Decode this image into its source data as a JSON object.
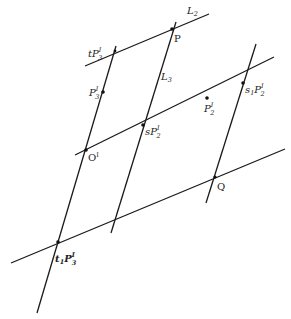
{
  "diagram": {
    "labels": {
      "L2": "L",
      "L2_sub": "2",
      "L3": "L",
      "L3_sub": "3",
      "P": "P",
      "tP3": "tP",
      "tP3_sub": "3",
      "tP3_sup": "I",
      "P3": "P",
      "P3_sub": "3",
      "P3_sup": "I",
      "O": "O",
      "O_sup": "I",
      "sP2": "sP",
      "sP2_sub": "2",
      "sP2_sup": "I",
      "P2": "P",
      "P2_sub": "2",
      "P2_sup": "I",
      "s1P2": "s",
      "s1P2_s_sub": "1",
      "s1P2_P": "P",
      "s1P2_sub": "2",
      "s1P2_sup": "I",
      "Q": "Q",
      "t1P3": "t",
      "t1P3_t_sub": "1",
      "t1P3_P": "P",
      "t1P3_sub": "3",
      "t1P3_sup": "I"
    },
    "lines": [
      {
        "name": "L2",
        "x1": 85,
        "y1": 66,
        "x2": 209,
        "y2": 14
      },
      {
        "name": "left-transversal",
        "x1": 116,
        "y1": 46,
        "x2": 37,
        "y2": 313
      },
      {
        "name": "L3",
        "x1": 176,
        "y1": 22,
        "x2": 111,
        "y2": 233
      },
      {
        "name": "right-transversal",
        "x1": 256,
        "y1": 44,
        "x2": 206,
        "y2": 203
      },
      {
        "name": "middle-line",
        "x1": 75,
        "y1": 155,
        "x2": 274,
        "y2": 57
      },
      {
        "name": "bottom-line",
        "x1": 11,
        "y1": 263,
        "x2": 285,
        "y2": 149
      }
    ],
    "points": [
      {
        "name": "P",
        "x": 172,
        "y": 29
      },
      {
        "name": "tP3",
        "x": 115,
        "y": 51
      },
      {
        "name": "P3",
        "x": 103,
        "y": 92
      },
      {
        "name": "O",
        "x": 86,
        "y": 150
      },
      {
        "name": "sP2",
        "x": 143,
        "y": 125
      },
      {
        "name": "P2",
        "x": 207,
        "y": 98
      },
      {
        "name": "s1P2",
        "x": 243,
        "y": 83
      },
      {
        "name": "Q",
        "x": 215,
        "y": 177
      },
      {
        "name": "t1P3",
        "x": 58,
        "y": 242
      }
    ]
  }
}
